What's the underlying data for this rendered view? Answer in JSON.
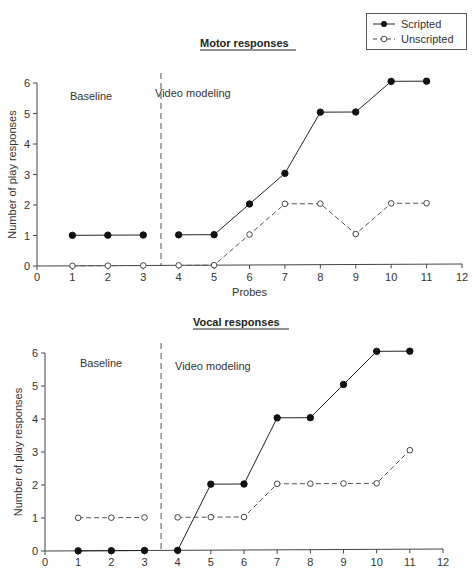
{
  "legend": {
    "items": [
      {
        "label": "Scripted",
        "marker": "filled-circle",
        "line": "solid"
      },
      {
        "label": "Unscripted",
        "marker": "open-circle",
        "line": "dashed"
      }
    ]
  },
  "charts": [
    {
      "title": "Motor responses",
      "ylabel": "Number of play responses",
      "xlabel": "Probes",
      "phase_labels": [
        "Baseline",
        "Video modeling"
      ],
      "xticks": [
        "0",
        "1",
        "2",
        "3",
        "4",
        "5",
        "6",
        "7",
        "8",
        "9",
        "10",
        "11",
        "12"
      ],
      "yticks": [
        "0",
        "1",
        "2",
        "3",
        "4",
        "5",
        "6"
      ]
    },
    {
      "title": "Vocal responses",
      "ylabel": "Number of play responses",
      "xlabel": "",
      "phase_labels": [
        "Baseline",
        "Video modeling"
      ],
      "xticks": [
        "0",
        "1",
        "2",
        "3",
        "4",
        "5",
        "6",
        "7",
        "8",
        "9",
        "10",
        "11",
        "12"
      ],
      "yticks": [
        "0",
        "1",
        "2",
        "3",
        "4",
        "5",
        "6"
      ]
    }
  ],
  "chart_data": [
    {
      "type": "line",
      "title": "Motor responses",
      "xlabel": "Probes",
      "ylabel": "Number of play responses",
      "x": [
        1,
        2,
        3,
        4,
        5,
        6,
        7,
        8,
        9,
        10,
        11
      ],
      "series": [
        {
          "name": "Scripted",
          "values": [
            1,
            1,
            1,
            1,
            1,
            2,
            3,
            5,
            5,
            6,
            6
          ]
        },
        {
          "name": "Unscripted",
          "values": [
            0,
            0,
            0,
            0,
            0,
            1,
            2,
            2,
            1,
            2,
            2
          ]
        }
      ],
      "phase_change_after_x": 3.5,
      "phases": [
        "Baseline",
        "Video modeling"
      ],
      "xlim": [
        0,
        12
      ],
      "ylim": [
        0,
        6
      ],
      "grid": false,
      "legend_position": "top-right"
    },
    {
      "type": "line",
      "title": "Vocal responses",
      "xlabel": "",
      "ylabel": "Number of play responses",
      "x": [
        1,
        2,
        3,
        4,
        5,
        6,
        7,
        8,
        9,
        10,
        11
      ],
      "series": [
        {
          "name": "Scripted",
          "values": [
            0,
            0,
            0,
            0,
            2,
            2,
            4,
            4,
            5,
            6,
            6
          ]
        },
        {
          "name": "Unscripted",
          "values": [
            1,
            1,
            1,
            1,
            1,
            1,
            2,
            2,
            2,
            2,
            3
          ]
        }
      ],
      "phase_change_after_x": 3.5,
      "phases": [
        "Baseline",
        "Video modeling"
      ],
      "xlim": [
        0,
        12
      ],
      "ylim": [
        0,
        6
      ],
      "grid": false
    }
  ]
}
